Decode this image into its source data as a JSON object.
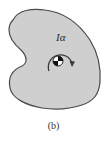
{
  "figure": {
    "label": "Iα",
    "caption": "(b)",
    "body_fill": "#cfcfcf",
    "body_stroke": "#4a4a4a",
    "arrow_color": "#3a3a3a",
    "moment_direction": "clockwise",
    "center_of_mass_symbol": "center-of-mass-icon"
  }
}
